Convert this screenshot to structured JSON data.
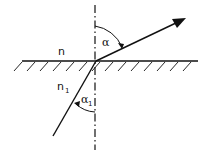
{
  "diagram": {
    "labels": {
      "upper_medium": "n",
      "lower_medium": "n",
      "lower_medium_sub": "1",
      "angle_upper": "α",
      "angle_lower": "α",
      "angle_lower_sub": "1"
    },
    "colors": {
      "stroke": "#111111",
      "background": "#ffffff"
    },
    "geometry": {
      "origin": [
        96,
        61
      ],
      "interface_y": 61,
      "interface_x_range": [
        22,
        198
      ],
      "normal_x": 95,
      "normal_y_range": [
        5,
        150
      ],
      "refracted_ray_tip": [
        186,
        18
      ],
      "incident_ray_start": [
        53,
        136
      ]
    }
  }
}
